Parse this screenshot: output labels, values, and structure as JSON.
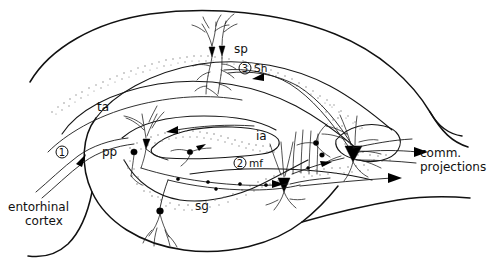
{
  "figure": {
    "background_color": "#ffffff",
    "ink_color": "#111111",
    "stipple_color": "#8a8a8a",
    "width": 495,
    "height": 266
  },
  "labels": {
    "sp": "sp",
    "sh": "Sh",
    "ta": "ta",
    "pp": "pp",
    "ia": "ia",
    "mf": "mf",
    "sg": "sg",
    "entorhinal_line1": "entorhinal",
    "entorhinal_line2": "cortex",
    "comm_line1": "comm.",
    "comm_line2": "projections"
  },
  "numbered_pathways": [
    {
      "number": "1",
      "label": "pp",
      "meaning": "perforant path"
    },
    {
      "number": "2",
      "label": "mf",
      "meaning": "mossy fibers"
    },
    {
      "number": "3",
      "label": "Sh",
      "meaning": "Schaffer collaterals"
    }
  ],
  "cell_layers": [
    {
      "name": "sp",
      "description": "stratum pyramidale band, CA1"
    },
    {
      "name": "sg",
      "description": "stratum granulosum band, dentate gyrus"
    }
  ],
  "icons": {
    "arrow": "arrowhead-icon",
    "soma": "neuron-soma-icon",
    "circled_number": "circled-number-icon"
  }
}
